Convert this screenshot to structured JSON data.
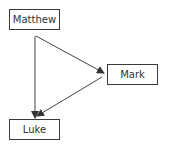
{
  "diagram": {
    "nodes": [
      {
        "id": "matthew",
        "label": "Matthew",
        "x": 9,
        "y": 9,
        "w": 51,
        "h": 21
      },
      {
        "id": "mark",
        "label": "Mark",
        "x": 107,
        "y": 64,
        "w": 51,
        "h": 21
      },
      {
        "id": "luke",
        "label": "Luke",
        "x": 9,
        "y": 119,
        "w": 51,
        "h": 21
      }
    ],
    "edges": [
      {
        "from": "matthew",
        "to": "luke"
      },
      {
        "from": "matthew",
        "to": "mark"
      },
      {
        "from": "mark",
        "to": "luke"
      }
    ],
    "colors": {
      "stroke": "#3a3a3a",
      "text": "#333333",
      "background": "#ffffff"
    }
  }
}
